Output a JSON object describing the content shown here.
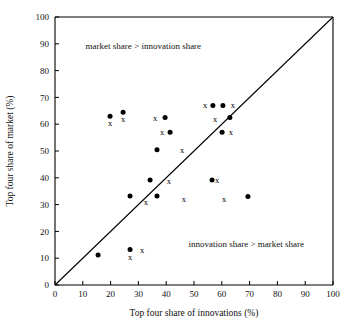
{
  "chart_data": {
    "type": "scatter",
    "title": "",
    "xlabel": "Top four share of innovations (%)",
    "ylabel": "Top four share of market (%)",
    "xlim": [
      0,
      100
    ],
    "ylim": [
      0,
      100
    ],
    "xticks": [
      0,
      10,
      20,
      30,
      40,
      50,
      60,
      70,
      80,
      90,
      100
    ],
    "yticks": [
      0,
      10,
      20,
      30,
      40,
      50,
      60,
      70,
      80,
      90,
      100
    ],
    "grid": false,
    "legend": "none",
    "reference_line": {
      "name": "forty-five-degree-line",
      "from": [
        0,
        0
      ],
      "to": [
        100,
        100
      ]
    },
    "annotations": [
      {
        "name": "market-share-greater",
        "text": "market share > innovation share",
        "x": 11,
        "y": 88
      },
      {
        "name": "innovation-share-greater",
        "text": "innovation share > market share",
        "x": 48,
        "y": 14
      }
    ],
    "series": [
      {
        "name": "filled-circle",
        "marker": "circle",
        "color": "#000000",
        "points": [
          [
            19.8,
            63.0
          ],
          [
            24.5,
            64.5
          ],
          [
            39.6,
            62.5
          ],
          [
            41.4,
            57.0
          ],
          [
            36.7,
            50.5
          ],
          [
            34.2,
            39.2
          ],
          [
            56.8,
            67.0
          ],
          [
            60.4,
            67.0
          ],
          [
            62.9,
            62.5
          ],
          [
            60.1,
            57.0
          ],
          [
            56.5,
            39.2
          ],
          [
            27.0,
            33.2
          ],
          [
            36.7,
            33.2
          ],
          [
            69.4,
            33.0
          ],
          [
            27.0,
            13.2
          ],
          [
            15.5,
            11.2
          ]
        ]
      },
      {
        "name": "x-marker",
        "marker": "x",
        "color": "#000000",
        "points": [
          [
            19.8,
            60.5
          ],
          [
            24.5,
            62.0
          ],
          [
            36.0,
            62.5
          ],
          [
            38.5,
            57.0
          ],
          [
            54.0,
            67.0
          ],
          [
            64.0,
            67.0
          ],
          [
            57.6,
            62.0
          ],
          [
            63.3,
            57.0
          ],
          [
            45.7,
            50.5
          ],
          [
            41.0,
            38.8
          ],
          [
            58.3,
            39.2
          ],
          [
            32.7,
            31.0
          ],
          [
            46.4,
            32.0
          ],
          [
            60.8,
            32.0
          ],
          [
            31.3,
            13.2
          ],
          [
            27.0,
            10.5
          ]
        ]
      }
    ]
  }
}
